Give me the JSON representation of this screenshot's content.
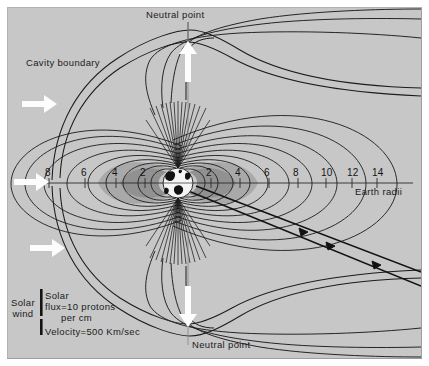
{
  "figure": {
    "title_labels": {
      "neutral_point_top": "Neutral point",
      "neutral_point_bottom": "Neutral point",
      "cavity_boundary": "Cavity boundary",
      "earth_radii_axis": "Earth radii",
      "solar_wind": "Solar\nwind"
    },
    "solar_wind_label_line1": "Solar",
    "solar_wind_label_line2": "wind",
    "legend": {
      "flux_line1": "Solar",
      "flux_line2": "flux=10 protons",
      "flux_line3": "per cm",
      "velocity": "Velocity=500 Km/sec"
    },
    "colors": {
      "background": "#c7c7c7",
      "field_line": "#1a1a1a",
      "belt_outer": "#a8a8a8",
      "belt_inner": "#909090",
      "white_arrow": "#fdfdfd",
      "page": "#ffffff",
      "text": "#161616"
    }
  },
  "chart_data": {
    "type": "diagram",
    "xlabel": "Earth radii",
    "ylabel": "",
    "axis": {
      "units": "Earth radii",
      "left_ticks": [
        8,
        6,
        4,
        2
      ],
      "right_ticks": [
        2,
        4,
        6,
        8,
        10,
        12,
        14
      ],
      "left_tick_x": [
        48,
        84,
        115,
        143
      ],
      "right_tick_x": [
        209,
        238,
        267,
        296,
        324,
        350,
        375
      ],
      "axis_y": 183,
      "earth_center_x": 178
    },
    "earth": {
      "center_x": 178,
      "center_y": 183,
      "radius": 15
    },
    "features": [
      {
        "name": "neutral-point-north",
        "x": 188,
        "y": 40
      },
      {
        "name": "neutral-point-south",
        "x": 188,
        "y": 326
      },
      {
        "name": "cavity-boundary",
        "note": "bow-shock / magnetopause outer boundary"
      },
      {
        "name": "radiation-belt-outer",
        "note": "shaded lobe, 2-5 Earth radii"
      },
      {
        "name": "radiation-belt-inner",
        "note": "darker shaded lobe, 1.5-3 Earth radii"
      },
      {
        "name": "satellite-trajectory",
        "note": "two parallel straight tracks with arrowheads, NW to SE"
      }
    ],
    "white_arrows": [
      {
        "name": "solar-wind-arrow-top",
        "x": 22,
        "y": 105,
        "dir": "right"
      },
      {
        "name": "solar-wind-arrow-mid",
        "x": 14,
        "y": 178,
        "dir": "right"
      },
      {
        "name": "solar-wind-arrow-bottom",
        "x": 30,
        "y": 248,
        "dir": "right"
      },
      {
        "name": "neutral-point-arrow-north",
        "x": 188,
        "y": 46,
        "dir": "up"
      },
      {
        "name": "neutral-point-arrow-south",
        "x": 188,
        "y": 288,
        "dir": "down"
      }
    ],
    "grid": false,
    "legend_position": "bottom-left"
  }
}
